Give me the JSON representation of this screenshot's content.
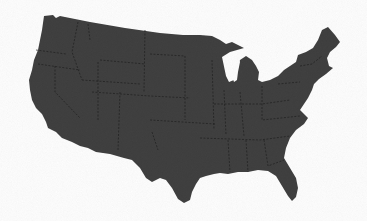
{
  "image": {
    "subject": "Map of the contiguous United States",
    "style": "dark gray silhouette with dashed state borders on white",
    "colors": {
      "land": "#3c3c3c",
      "borders": "#1e1e1e",
      "background": "#ffffff"
    }
  },
  "caption": ""
}
